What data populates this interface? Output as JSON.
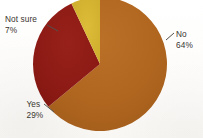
{
  "chart_data": {
    "type": "pie",
    "title": "",
    "subtitle": "",
    "xlabel": "",
    "ylabel": "",
    "legend_position": "none",
    "grid": false,
    "categories": [
      "No",
      "Yes",
      "Not sure"
    ],
    "values": [
      64,
      29,
      7
    ],
    "units": "percent",
    "slices": [
      {
        "label": "No",
        "value": 64,
        "value_text": "64%",
        "color": "#b0661f",
        "start_angle_deg": 0,
        "end_angle_deg": 230.4,
        "label_position": "right"
      },
      {
        "label": "Yes",
        "value": 29,
        "value_text": "29%",
        "color": "#8c1a14",
        "start_angle_deg": 230.4,
        "end_angle_deg": 334.8,
        "label_position": "lower-left"
      },
      {
        "label": "Not sure",
        "value": 7,
        "value_text": "7%",
        "color": "#d0b02e",
        "start_angle_deg": 334.8,
        "end_angle_deg": 360,
        "label_position": "upper-left"
      }
    ]
  },
  "labels": {
    "no": {
      "name": "No",
      "pct": "64%"
    },
    "yes": {
      "name": "Yes",
      "pct": "29%"
    },
    "not_sure": {
      "name": "Not sure",
      "pct": "7%"
    }
  },
  "colors": {
    "no": "#b0661f",
    "yes": "#8c1a14",
    "not_sure": "#d0b02e",
    "label_text": "#3a3530",
    "leader_line": "#55504a",
    "background": "#fdfdfb"
  },
  "geometry": {
    "center_x": 100,
    "center_y": 64,
    "radius": 67
  }
}
